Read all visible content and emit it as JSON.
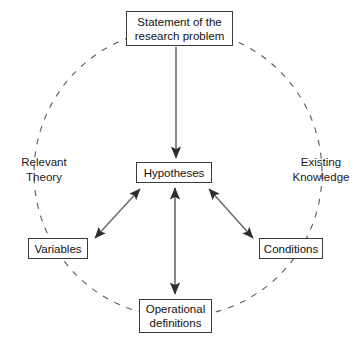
{
  "diagram": {
    "style": {
      "background_color": "#ffffff",
      "box_border_color": "#3a3a3a",
      "text_color": "#111111",
      "arrow_color": "#4a4a4a",
      "dashed_circle_color": "#555555"
    },
    "nodes": {
      "statement": {
        "line1": "Statement of the",
        "line2": "research problem"
      },
      "hypotheses": {
        "line1": "Hypotheses"
      },
      "variables": {
        "line1": "Variables"
      },
      "conditions": {
        "line1": "Conditions"
      },
      "operational": {
        "line1": "Operational",
        "line2": "definitions"
      }
    },
    "side_labels": {
      "left": {
        "line1": "Relevant",
        "line2": "Theory"
      },
      "right": {
        "line1": "Existing",
        "line2": "Knowledge"
      }
    },
    "connectors": [
      {
        "name": "statement-to-hypotheses",
        "from": "statement",
        "to": "hypotheses",
        "style": "single-arrow-down"
      },
      {
        "name": "hypotheses-to-variables",
        "from": "hypotheses",
        "to": "variables",
        "style": "double-arrow"
      },
      {
        "name": "hypotheses-to-conditions",
        "from": "hypotheses",
        "to": "conditions",
        "style": "double-arrow"
      },
      {
        "name": "hypotheses-to-operational",
        "from": "hypotheses",
        "to": "operational",
        "style": "double-arrow"
      }
    ],
    "circle": {
      "name": "dashed-context-circle",
      "center_x": 178,
      "center_y": 173,
      "radius": 144,
      "dash": "6 7"
    }
  }
}
